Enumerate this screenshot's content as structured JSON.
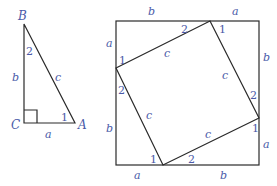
{
  "triangle": {
    "vertices": {
      "B": "B",
      "C": "C",
      "A": "A"
    },
    "sides": {
      "b": "b",
      "c": "c",
      "a": "a"
    },
    "angles": {
      "at_B": "2",
      "at_A": "1"
    }
  },
  "square": {
    "outer_sides": {
      "top_left": "b",
      "top_right": "a",
      "left_top": "a",
      "left_bottom": "b",
      "right_top": "b",
      "right_bottom": "a",
      "bottom_left": "a",
      "bottom_right": "b"
    },
    "inner_sides": {
      "top": "c",
      "left": "c",
      "right": "c",
      "bottom": "c"
    },
    "angle_labels": {
      "top_vertex_left": "2",
      "top_vertex_right": "1",
      "left_vertex_top": "1",
      "left_vertex_bottom": "2",
      "right_vertex_top": "2",
      "right_vertex_bottom": "1",
      "bottom_vertex_left": "1",
      "bottom_vertex_right": "2"
    }
  },
  "colors": {
    "label": "#4a5aa8",
    "line": "#2a2a2a"
  }
}
